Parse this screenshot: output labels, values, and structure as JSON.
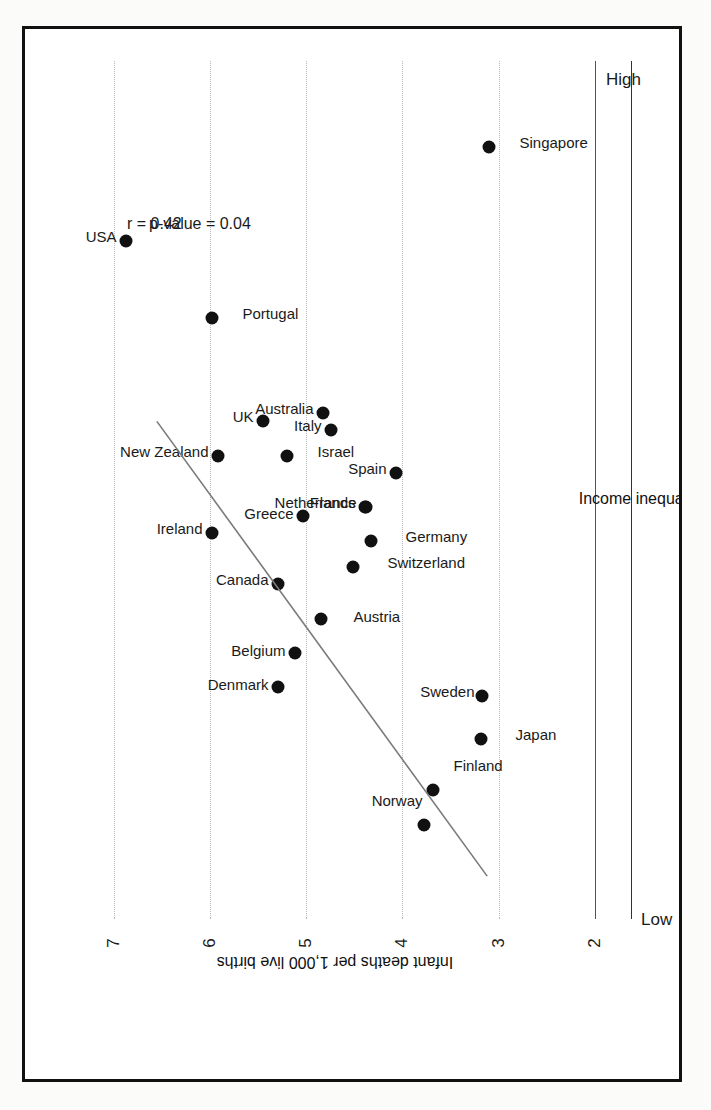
{
  "chart_data": {
    "type": "scatter",
    "title": "Infant mortality rates are higher in more unequal countries",
    "xlabel": "Income inequality",
    "ylabel": "Infant deaths per 1,000 live births",
    "x_low_label": "Low",
    "x_high_label": "High",
    "xlim": [
      0,
      100
    ],
    "ylim": [
      2,
      7.4
    ],
    "yticks": [
      "7",
      "6",
      "5",
      "4",
      "3",
      "2"
    ],
    "ytick_values": [
      7,
      6,
      5,
      4,
      3,
      2
    ],
    "gridlines_at": [
      7,
      6,
      5,
      4,
      3
    ],
    "grid": true,
    "legend": "none",
    "annotations": [
      "r = 0.42",
      "p-value = 0.04"
    ],
    "r": "r = 0.42",
    "p_value": "p-value = 0.04",
    "trendline": {
      "x0": 5,
      "y0": 3.12,
      "x1": 58,
      "y1": 6.55
    },
    "points": [
      {
        "label": "Japan",
        "x": 21,
        "y": 3.18
      },
      {
        "label": "Sweden",
        "x": 26,
        "y": 3.17
      },
      {
        "label": "Finland",
        "x": 15,
        "y": 3.68
      },
      {
        "label": "Norway",
        "x": 11,
        "y": 3.78
      },
      {
        "label": "Denmark",
        "x": 27,
        "y": 5.29
      },
      {
        "label": "Austria",
        "x": 35,
        "y": 4.85
      },
      {
        "label": "Belgium",
        "x": 31,
        "y": 5.12
      },
      {
        "label": "Germany",
        "x": 44,
        "y": 4.33
      },
      {
        "label": "Switzerland",
        "x": 41,
        "y": 4.51
      },
      {
        "label": "Netherlands",
        "x": 48,
        "y": 4.39
      },
      {
        "label": "France",
        "x": 48,
        "y": 4.38
      },
      {
        "label": "Spain",
        "x": 52,
        "y": 4.07
      },
      {
        "label": "Canada",
        "x": 39,
        "y": 5.29
      },
      {
        "label": "Greece",
        "x": 47,
        "y": 5.03
      },
      {
        "label": "Ireland",
        "x": 45,
        "y": 5.98
      },
      {
        "label": "Italy",
        "x": 57,
        "y": 4.74
      },
      {
        "label": "Israel",
        "x": 54,
        "y": 5.2
      },
      {
        "label": "Australia",
        "x": 59,
        "y": 4.82
      },
      {
        "label": "UK",
        "x": 58,
        "y": 5.45
      },
      {
        "label": "New Zealand",
        "x": 54,
        "y": 5.92
      },
      {
        "label": "Portugal",
        "x": 70,
        "y": 5.98
      },
      {
        "label": "USA",
        "x": 79,
        "y": 6.87
      },
      {
        "label": "Singapore",
        "x": 90,
        "y": 3.1
      }
    ]
  }
}
